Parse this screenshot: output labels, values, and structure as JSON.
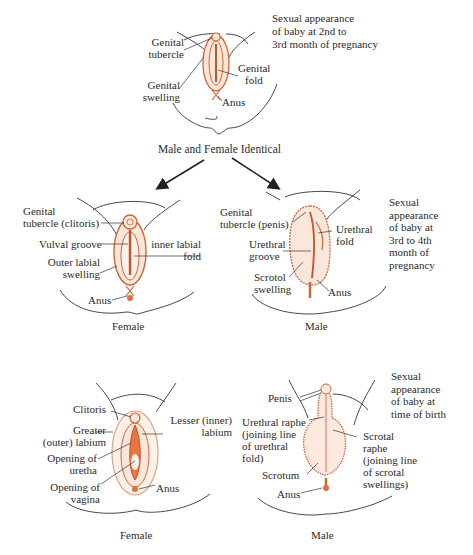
{
  "title_banner": "Male and Female Identical",
  "colors": {
    "organ_stroke": "#d2643a",
    "organ_fill": "#fbe3d6",
    "outline": "#333333",
    "text": "#2b2b2b"
  },
  "stage1": {
    "caption_lines": [
      "Sexual appearance",
      "of baby at 2nd to",
      "3rd month of pregnancy"
    ],
    "labels": {
      "genital_tubercle": [
        "Genital",
        "tubercle"
      ],
      "genital_swelling": [
        "Genital",
        "swelling"
      ],
      "genital_fold": [
        "Genital",
        "fold"
      ],
      "anus": "Anus"
    }
  },
  "stage2": {
    "caption_lines": [
      "Sexual",
      "appearance",
      "of baby at",
      "3rd to 4th",
      "month of",
      "pregnancy"
    ],
    "female": {
      "title": "Female",
      "labels": {
        "genital_tubercle": [
          "Genital",
          "tubercle (clitoris)"
        ],
        "vulval_groove": "Vulval groove",
        "outer_labial_swelling": [
          "Outer labial",
          "swelling"
        ],
        "inner_labial_fold": [
          "inner labial",
          "fold"
        ],
        "anus": "Anus"
      }
    },
    "male": {
      "title": "Male",
      "labels": {
        "genital_tubercle": [
          "Genital",
          "tubercle (penis)"
        ],
        "urethral_groove": [
          "Urethral",
          "groove"
        ],
        "scrotol_swelling": [
          "Scrotol",
          "swelling"
        ],
        "urethral_fold": [
          "Urethral",
          "fold"
        ],
        "anus": "Anus"
      }
    }
  },
  "stage3": {
    "caption_lines": [
      "Sexual",
      "appearance",
      "of baby at",
      "time of birth"
    ],
    "female": {
      "title": "Female",
      "labels": {
        "clitoris": "Clitoris",
        "greater_labium": [
          "Greater",
          "(outer) labium"
        ],
        "opening_urethra": [
          "Opening of",
          "uretha"
        ],
        "opening_vagina": [
          "Opening of",
          "vagina"
        ],
        "lesser_labium": [
          "Lesser (inner)",
          "labium"
        ],
        "anus": "Anus"
      }
    },
    "male": {
      "title": "Male",
      "labels": {
        "penis": "Penis",
        "urethral_raphe": [
          "Urethral raphe",
          "(joining line",
          "of urethral",
          "fold)"
        ],
        "scrotum": "Scrotum",
        "anus": "Anus",
        "scrotal_raphe": [
          "Scrotal",
          "raphe",
          "(joining line",
          "of scrotal",
          "swellings)"
        ]
      }
    }
  }
}
